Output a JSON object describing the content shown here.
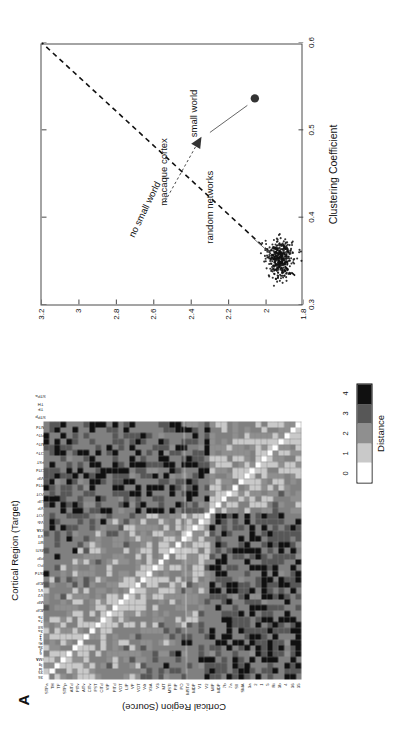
{
  "figure": {
    "panel_a_letter": "A",
    "panel_b_letter": "B"
  },
  "panel_a": {
    "x_axis_title": "Cortical Region (Target)",
    "y_axis_title": "Cortical Region (Source)",
    "colorbar": {
      "title": "Distance",
      "ticks": [
        "0",
        "1",
        "2",
        "3",
        "4"
      ],
      "colors": [
        "#ffffff",
        "#c9c9c9",
        "#8f8f8f",
        "#575757",
        "#101010"
      ]
    },
    "background_color": "#808080",
    "region_labels": [
      "STPa",
      "TH",
      "TF",
      "STPp",
      "AITd",
      "PITv",
      "AITv",
      "CITv",
      "FST",
      "CITd",
      "VIP",
      "PITd",
      "VOT",
      "LIP",
      "VP",
      "VOT",
      "V4t",
      "V3A",
      "V3",
      "MT",
      "MSTl",
      "PIP",
      "PO",
      "MSTd",
      "MDP",
      "V1",
      "V2",
      "MIP",
      "MDP",
      "7b",
      "7a",
      "SII",
      "SMA",
      "3a",
      "2",
      "1",
      "5",
      "Ri",
      "3b",
      "4",
      "36",
      "35"
    ],
    "target_labels": [
      "36",
      "35",
      "Id",
      "Ig",
      "SMA",
      "6",
      "4",
      "3b",
      "Ri",
      "5",
      "1",
      "2",
      "3a",
      "SII",
      "7a",
      "7b",
      "MDP",
      "MIP",
      "V2",
      "V1",
      "MDP",
      "MSTd",
      "PO",
      "PIP",
      "MSTl",
      "MT",
      "V3",
      "V3A",
      "V4t",
      "VOT",
      "VP",
      "LIP",
      "VOT",
      "PITd",
      "VIP",
      "CITd",
      "FST",
      "CITv",
      "AITv",
      "PITv",
      "AITd",
      "STPp",
      "TF",
      "TH",
      "STPa"
    ],
    "matrix_size": 45,
    "description": "Grayscale distance matrix of macaque cortical connectivity; white diagonal, 5 distance levels"
  },
  "chart_data": {
    "type": "scatter",
    "title": "",
    "xlabel": "Clustering Coefficient",
    "ylabel": "Path Length",
    "xlim": [
      0.3,
      0.6
    ],
    "ylim": [
      1.8,
      3.2
    ],
    "xticks": [
      "0.3",
      "0.4",
      "0.5",
      "0.6"
    ],
    "xtick_values": [
      0.3,
      0.4,
      0.5,
      0.6
    ],
    "yticks": [
      "1.8",
      "2",
      "2.2",
      "2.4",
      "2.6",
      "2.8",
      "3",
      "3.2"
    ],
    "ytick_values": [
      1.8,
      2.0,
      2.2,
      2.4,
      2.6,
      2.8,
      3.0,
      3.2
    ],
    "grid": false,
    "legend": null,
    "series": [
      {
        "name": "random networks",
        "marker": "dot",
        "color": "#111111",
        "n_points": 400,
        "x_center": 0.352,
        "y_center": 1.925,
        "x_spread": 0.011,
        "y_spread": 0.035
      },
      {
        "name": "macaque cortex",
        "marker": "filled-circle",
        "color": "#333333",
        "points": [
          [
            0.536,
            2.06
          ]
        ]
      }
    ],
    "lines": [
      {
        "name": "no small world",
        "style": "dashed",
        "from": [
          0.333,
          1.845
        ],
        "to": [
          0.6,
          3.2
        ],
        "label": "no small world"
      }
    ],
    "annotations": [
      {
        "text": "macaque cortex",
        "target": [
          0.536,
          2.06
        ]
      },
      {
        "text": "small world",
        "target": [
          0.497,
          2.3
        ]
      },
      {
        "text": "random networks",
        "target": [
          0.352,
          1.92
        ]
      },
      {
        "text": "no small world",
        "target": [
          0.45,
          2.6
        ]
      }
    ]
  }
}
